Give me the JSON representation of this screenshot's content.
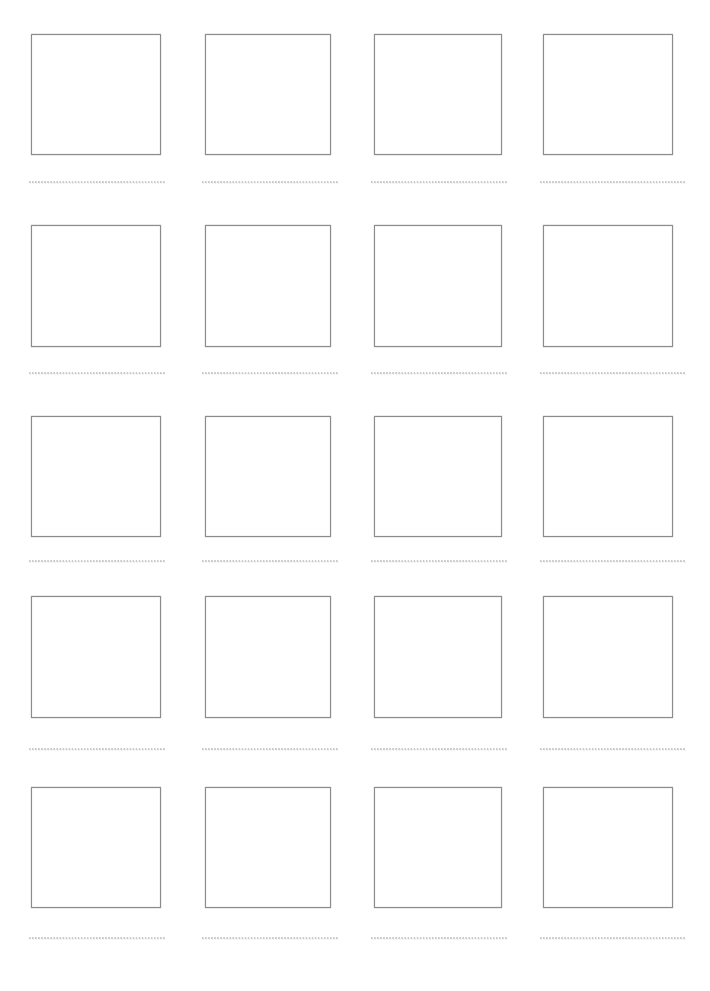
{
  "page": {
    "background_color": "#ffffff",
    "width": 710,
    "height": 991
  },
  "style": {
    "box_border_color": "#8c8c8e",
    "box_border_width_px": 1.4,
    "box_fill_color": "#ffffff",
    "rule_dot_color": "#b9b9c0",
    "rule_dot_spacing_px": 3.05
  },
  "grid": {
    "columns": 4,
    "rows": 5,
    "total_cells": 20,
    "column_x": [
      31,
      205,
      374,
      543
    ],
    "column_width": [
      130,
      126,
      128,
      130
    ],
    "row_y": [
      34,
      225,
      416,
      596,
      787
    ],
    "box_height": [
      121,
      122,
      121,
      122,
      121
    ],
    "rule_y": [
      181,
      372,
      560,
      748,
      937
    ],
    "rule_x": [
      29,
      202,
      371,
      540
    ],
    "rule_width": [
      136,
      136,
      137,
      146
    ]
  },
  "cells": [
    {
      "id": "cell-r1c1",
      "row": 1,
      "column": 1,
      "box_label": "",
      "line_text": ""
    },
    {
      "id": "cell-r1c2",
      "row": 1,
      "column": 2,
      "box_label": "",
      "line_text": ""
    },
    {
      "id": "cell-r1c3",
      "row": 1,
      "column": 3,
      "box_label": "",
      "line_text": ""
    },
    {
      "id": "cell-r1c4",
      "row": 1,
      "column": 4,
      "box_label": "",
      "line_text": ""
    },
    {
      "id": "cell-r2c1",
      "row": 2,
      "column": 1,
      "box_label": "",
      "line_text": ""
    },
    {
      "id": "cell-r2c2",
      "row": 2,
      "column": 2,
      "box_label": "",
      "line_text": ""
    },
    {
      "id": "cell-r2c3",
      "row": 2,
      "column": 3,
      "box_label": "",
      "line_text": ""
    },
    {
      "id": "cell-r2c4",
      "row": 2,
      "column": 4,
      "box_label": "",
      "line_text": ""
    },
    {
      "id": "cell-r3c1",
      "row": 3,
      "column": 1,
      "box_label": "",
      "line_text": ""
    },
    {
      "id": "cell-r3c2",
      "row": 3,
      "column": 2,
      "box_label": "",
      "line_text": ""
    },
    {
      "id": "cell-r3c3",
      "row": 3,
      "column": 3,
      "box_label": "",
      "line_text": ""
    },
    {
      "id": "cell-r3c4",
      "row": 3,
      "column": 4,
      "box_label": "",
      "line_text": ""
    },
    {
      "id": "cell-r4c1",
      "row": 4,
      "column": 1,
      "box_label": "",
      "line_text": ""
    },
    {
      "id": "cell-r4c2",
      "row": 4,
      "column": 2,
      "box_label": "",
      "line_text": ""
    },
    {
      "id": "cell-r4c3",
      "row": 4,
      "column": 3,
      "box_label": "",
      "line_text": ""
    },
    {
      "id": "cell-r4c4",
      "row": 4,
      "column": 4,
      "box_label": "",
      "line_text": ""
    },
    {
      "id": "cell-r5c1",
      "row": 5,
      "column": 1,
      "box_label": "",
      "line_text": ""
    },
    {
      "id": "cell-r5c2",
      "row": 5,
      "column": 2,
      "box_label": "",
      "line_text": ""
    },
    {
      "id": "cell-r5c3",
      "row": 5,
      "column": 3,
      "box_label": "",
      "line_text": ""
    },
    {
      "id": "cell-r5c4",
      "row": 5,
      "column": 4,
      "box_label": "",
      "line_text": ""
    }
  ]
}
